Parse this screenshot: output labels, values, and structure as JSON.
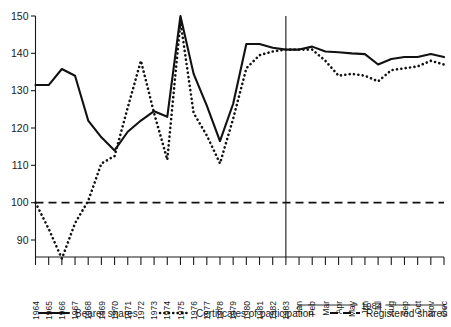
{
  "chart_data": {
    "type": "line",
    "title": "",
    "subtitle": "",
    "xlabel": "",
    "ylabel": "",
    "ylim": [
      84,
      152
    ],
    "yticks": [
      90,
      100,
      110,
      120,
      130,
      140,
      150
    ],
    "ytick_labels": [
      "90",
      "100",
      "110",
      "120",
      "130",
      "140",
      "150"
    ],
    "grid": false,
    "legend_position": "bottom",
    "annotations": [
      {
        "name": "period-brace",
        "label": "1984",
        "covers": "Jan-Dec"
      },
      {
        "name": "year-divider",
        "label": "",
        "at": "1983"
      }
    ],
    "categories": [
      "1964",
      "1965",
      "1966",
      "1967",
      "1968",
      "1969",
      "1970",
      "1971",
      "1972",
      "1973",
      "1974",
      "1975",
      "1976",
      "1977",
      "1978",
      "1979",
      "1980",
      "1981",
      "1982",
      "1983",
      "Jan",
      "Feb",
      "Mar",
      "Apr",
      "May",
      "Jun",
      "Jul",
      "Aug",
      "Sep",
      "Oct",
      "Nov",
      "Dec"
    ],
    "series": [
      {
        "name": "Bearer shares",
        "style": "solid",
        "values": [
          131.5,
          131.5,
          135.8,
          134.0,
          122.0,
          117.5,
          114.0,
          119.0,
          122.0,
          124.5,
          123.0,
          150.0,
          134.5,
          126.0,
          116.5,
          126.5,
          142.5,
          142.5,
          141.5,
          141.0,
          141.0,
          141.8,
          140.5,
          140.3,
          140.0,
          139.8,
          137.0,
          138.5,
          139.0,
          139.0,
          139.8,
          139.0
        ]
      },
      {
        "name": "Certificates of participation",
        "style": "dotted",
        "values": [
          100.0,
          93.0,
          85.0,
          94.5,
          100.5,
          110.5,
          112.5,
          125.5,
          138.0,
          124.0,
          111.5,
          148.5,
          124.0,
          118.0,
          110.5,
          122.5,
          136.0,
          139.5,
          140.5,
          141.0,
          141.0,
          141.0,
          138.0,
          134.0,
          134.5,
          134.0,
          132.5,
          135.5,
          136.0,
          136.5,
          138.0,
          137.0
        ]
      },
      {
        "name": "Registered shares",
        "style": "dashed",
        "values": [
          100,
          100,
          100,
          100,
          100,
          100,
          100,
          100,
          100,
          100,
          100,
          100,
          100,
          100,
          100,
          100,
          100,
          100,
          100,
          100,
          100,
          100,
          100,
          100,
          100,
          100,
          100,
          100,
          100,
          100,
          100,
          100
        ]
      }
    ]
  },
  "legend": {
    "items": [
      {
        "label": "Bearer shares",
        "style": "solid"
      },
      {
        "label": "Certificates of participation",
        "style": "dotted"
      },
      {
        "label": "Registered shares",
        "style": "dashed"
      }
    ]
  }
}
